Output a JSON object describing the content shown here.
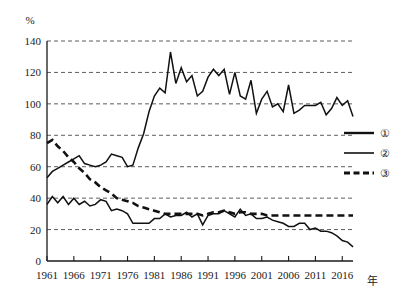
{
  "chart_data": {
    "type": "line",
    "title": "",
    "xlabel": "年",
    "ylabel": "%",
    "ylim": [
      0,
      140
    ],
    "xlim": [
      1961,
      2018
    ],
    "grid": true,
    "legend_position": "right-middle",
    "y_ticks": [
      "0",
      "20",
      "40",
      "60",
      "80",
      "100",
      "120",
      "140"
    ],
    "y_tick_values": [
      0,
      20,
      40,
      60,
      80,
      100,
      120,
      140
    ],
    "x_ticks": [
      "1961",
      "1966",
      "1971",
      "1976",
      "1981",
      "1986",
      "1991",
      "1996",
      "2001",
      "2006",
      "2011",
      "2016"
    ],
    "x_tick_values": [
      1961,
      1966,
      1971,
      1976,
      1981,
      1986,
      1991,
      1996,
      2001,
      2006,
      2011,
      2016
    ],
    "x": [
      1961,
      1962,
      1963,
      1964,
      1965,
      1966,
      1967,
      1968,
      1969,
      1970,
      1971,
      1972,
      1973,
      1974,
      1975,
      1976,
      1977,
      1978,
      1979,
      1980,
      1981,
      1982,
      1983,
      1984,
      1985,
      1986,
      1987,
      1988,
      1989,
      1990,
      1991,
      1992,
      1993,
      1994,
      1995,
      1996,
      1997,
      1998,
      1999,
      2000,
      2001,
      2002,
      2003,
      2004,
      2005,
      2006,
      2007,
      2008,
      2009,
      2010,
      2011,
      2012,
      2013,
      2014,
      2015,
      2016,
      2017,
      2018
    ],
    "series": [
      {
        "name": "①",
        "style": "solid-thick",
        "values": [
          53,
          57,
          59,
          61,
          63,
          65,
          67,
          62,
          61,
          60,
          61,
          63,
          68,
          67,
          66,
          60,
          61,
          72,
          81,
          95,
          105,
          110,
          107,
          133,
          113,
          123,
          114,
          118,
          105,
          108,
          117,
          122,
          118,
          122,
          106,
          120,
          105,
          103,
          115,
          94,
          103,
          108,
          98,
          100,
          95,
          112,
          94,
          96,
          99,
          99,
          99,
          101,
          93,
          97,
          104,
          99,
          102,
          92
        ]
      },
      {
        "name": "②",
        "style": "solid-thin",
        "values": [
          36,
          41,
          37,
          41,
          36,
          40,
          36,
          38,
          35,
          36,
          39,
          38,
          32,
          33,
          32,
          30,
          24,
          24,
          24,
          24,
          27,
          27,
          30,
          28,
          29,
          29,
          31,
          28,
          30,
          23,
          29,
          30,
          30,
          32,
          30,
          28,
          33,
          29,
          30,
          27,
          27,
          28,
          26,
          25,
          24,
          22,
          22,
          24,
          24,
          20,
          21,
          19,
          19,
          18,
          16,
          13,
          12,
          9
        ]
      },
      {
        "name": "③",
        "style": "dashed",
        "values": [
          75,
          77,
          73,
          70,
          66,
          63,
          59,
          56,
          52,
          50,
          47,
          45,
          43,
          40,
          39,
          38,
          37,
          35,
          34,
          33,
          32,
          31,
          30,
          30,
          30,
          30,
          30,
          30,
          30,
          29,
          30,
          31,
          31,
          32,
          31,
          30,
          31,
          31,
          30,
          30,
          30,
          29,
          29,
          29,
          29,
          29,
          29,
          29,
          29,
          29,
          29,
          29,
          29,
          29,
          29,
          29,
          29,
          29
        ]
      }
    ],
    "legend": [
      {
        "label": "①",
        "style": "solid-thick"
      },
      {
        "label": "②",
        "style": "solid-thin"
      },
      {
        "label": "③",
        "style": "dashed"
      }
    ]
  }
}
